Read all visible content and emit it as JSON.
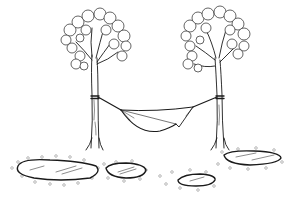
{
  "illustration": {
    "subject": "Hammock strung between two trees above stepping stones",
    "style": "black line art on white",
    "colors": {
      "background": "#ffffff",
      "ink": "#1a1a1a",
      "pebbles": "#777777"
    },
    "elements": {
      "left_tree": {
        "trunk_x": 95,
        "canopy_center": [
          98,
          40
        ]
      },
      "right_tree": {
        "trunk_x": 220,
        "canopy_center": [
          214,
          40
        ]
      },
      "hammock": {
        "left_anchor": [
          95,
          97
        ],
        "right_anchor": [
          220,
          97
        ]
      },
      "stones": [
        {
          "cx": 58,
          "cy": 172,
          "rx": 42,
          "ry": 11
        },
        {
          "cx": 126,
          "cy": 171,
          "rx": 20,
          "ry": 8
        },
        {
          "cx": 195,
          "cy": 180,
          "rx": 20,
          "ry": 7
        },
        {
          "cx": 252,
          "cy": 159,
          "rx": 30,
          "ry": 8
        }
      ]
    }
  }
}
